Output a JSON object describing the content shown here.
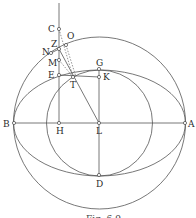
{
  "diagram": {
    "caption": "Fig. 6.9",
    "points": [
      {
        "label": "A",
        "x": 185,
        "y": 123
      },
      {
        "label": "B",
        "x": 14,
        "y": 123
      },
      {
        "label": "C",
        "x": 59,
        "y": 29
      },
      {
        "label": "D",
        "x": 99,
        "y": 175
      },
      {
        "label": "E",
        "x": 59,
        "y": 75
      },
      {
        "label": "G",
        "x": 99,
        "y": 69
      },
      {
        "label": "H",
        "x": 59,
        "y": 123
      },
      {
        "label": "K",
        "x": 99,
        "y": 77
      },
      {
        "label": "L",
        "x": 99,
        "y": 123
      },
      {
        "label": "M",
        "x": 59,
        "y": 60
      },
      {
        "label": "N",
        "x": 51,
        "y": 53
      },
      {
        "label": "O",
        "x": 66,
        "y": 45
      },
      {
        "label": "T",
        "x": 73,
        "y": 77
      },
      {
        "label": "Z",
        "x": 59,
        "y": 49
      }
    ],
    "labels": {
      "A": "A",
      "B": "B",
      "C": "C",
      "D": "D",
      "E": "E",
      "G": "G",
      "H": "H",
      "K": "K",
      "L": "L",
      "M": "M",
      "N": "N",
      "O": "O",
      "T": "T",
      "Z": "Z"
    },
    "shapes": [
      {
        "type": "circle",
        "name": "outer-circle",
        "center": "L",
        "radius": 86
      },
      {
        "type": "ellipse",
        "name": "ellipse",
        "center": "L",
        "rx": 86,
        "ry": 53
      },
      {
        "type": "circle",
        "name": "inner-circle",
        "center": "L",
        "radius": 53
      }
    ],
    "colors": {
      "line": "#555555",
      "text": "#2a2a2a",
      "background": "#ffffff"
    }
  }
}
